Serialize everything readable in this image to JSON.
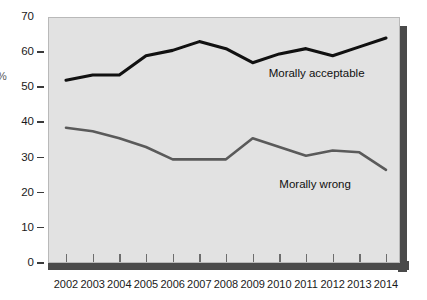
{
  "chart_data": {
    "type": "line",
    "title": "",
    "subtitle": "",
    "xlabel": "",
    "ylabel": "%",
    "categories": [
      "2002",
      "2003",
      "2004",
      "2005",
      "2006",
      "2007",
      "2008",
      "2009",
      "2010",
      "2011",
      "2012",
      "2013",
      "2014"
    ],
    "x": [
      2002,
      2003,
      2004,
      2005,
      2006,
      2007,
      2008,
      2009,
      2010,
      2011,
      2012,
      2013,
      2014
    ],
    "xlim": [
      2002,
      2014
    ],
    "ylim": [
      0,
      70
    ],
    "yticks": [
      0,
      10,
      20,
      30,
      40,
      50,
      60,
      70
    ],
    "ytick_labels": [
      "0",
      "10",
      "20",
      "30",
      "40",
      "50",
      "60",
      "70"
    ],
    "grid": false,
    "legend_position": "inline-annotation",
    "series": [
      {
        "name": "Morally acceptable",
        "color": "#111111",
        "values": [
          52,
          53.5,
          53.5,
          59,
          60.5,
          63,
          61,
          57,
          59.5,
          61,
          59,
          61.5,
          64
        ]
      },
      {
        "name": "Morally wrong",
        "color": "#5a5a5a",
        "values": [
          38.5,
          37.5,
          35.5,
          33,
          29.5,
          29.5,
          29.5,
          35.5,
          33,
          30.5,
          32,
          31.5,
          26.5
        ]
      }
    ],
    "annotations": [
      {
        "text": "Morally acceptable",
        "x": 2009.6,
        "y": 53.5
      },
      {
        "text": "Morally wrong",
        "x": 2010.0,
        "y": 22.0
      }
    ]
  },
  "style": {
    "panel_bg": "#e2e2e2",
    "page_bg": "#ffffff",
    "shadow_color": "#4a4a4a",
    "tick_color": "#3a3a3a",
    "text_color": "#1a1a1a"
  }
}
